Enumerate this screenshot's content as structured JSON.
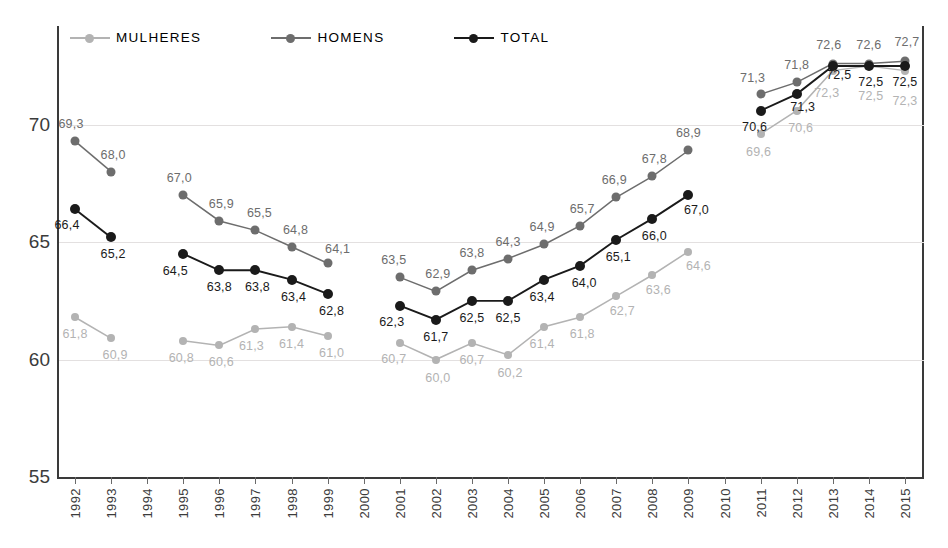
{
  "chart_data": {
    "type": "line",
    "title": "",
    "xlabel": "",
    "ylabel": "",
    "ylim": [
      55,
      74.2
    ],
    "yticks": [
      "55",
      "60",
      "65",
      "70"
    ],
    "grid": true,
    "legend_position": "top-left",
    "categories": [
      "1992",
      "1993",
      "1994",
      "1995",
      "1996",
      "1997",
      "1998",
      "1999",
      "2000",
      "2001",
      "2002",
      "2003",
      "2004",
      "2005",
      "2006",
      "2007",
      "2008",
      "2009",
      "2010",
      "2011",
      "2012",
      "2013",
      "2014",
      "2015"
    ],
    "series": [
      {
        "name": "MULHERES",
        "color": "#b3b3b3",
        "values": [
          61.8,
          60.9,
          null,
          60.8,
          60.6,
          61.3,
          61.4,
          61.0,
          null,
          60.7,
          60.0,
          60.7,
          60.2,
          61.4,
          61.8,
          62.7,
          63.6,
          64.6,
          null,
          69.6,
          70.6,
          72.3,
          72.5,
          72.3
        ],
        "labels": [
          "61,8",
          "60,9",
          null,
          "60,8",
          "60,6",
          "61,3",
          "61,4",
          "61,0",
          null,
          "60,7",
          "60,0",
          "60,7",
          "60,2",
          "61,4",
          "61,8",
          "62,7",
          "63,6",
          "64,6",
          null,
          "69,6",
          "70,6",
          "72,3",
          "72,5",
          "72,3"
        ]
      },
      {
        "name": "HOMENS",
        "color": "#6d6d6d",
        "values": [
          69.3,
          68.0,
          null,
          67.0,
          65.9,
          65.5,
          64.8,
          64.1,
          null,
          63.5,
          62.9,
          63.8,
          64.3,
          64.9,
          65.7,
          66.9,
          67.8,
          68.9,
          null,
          71.3,
          71.8,
          72.6,
          72.6,
          72.7
        ],
        "labels": [
          "69,3",
          "68,0",
          null,
          "67,0",
          "65,9",
          "65,5",
          "64,8",
          "64,1",
          null,
          "63,5",
          "62,9",
          "63,8",
          "64,3",
          "64,9",
          "65,7",
          "66,9",
          "67,8",
          "68,9",
          null,
          "71,3",
          "71,8",
          "72,6",
          "72,6",
          "72,7"
        ]
      },
      {
        "name": "TOTAL",
        "color": "#1a1a1a",
        "values": [
          66.4,
          65.2,
          null,
          64.5,
          63.8,
          63.8,
          63.4,
          62.8,
          null,
          62.3,
          61.7,
          62.5,
          62.5,
          63.4,
          64.0,
          65.1,
          66.0,
          67.0,
          null,
          70.6,
          71.3,
          72.5,
          72.5,
          72.5
        ],
        "labels": [
          "66,4",
          "65,2",
          null,
          "64,5",
          "63,8",
          "63,8",
          "63,4",
          "62,8",
          null,
          "62,3",
          "61,7",
          "62,5",
          "62,5",
          "63,4",
          "64,0",
          "65,1",
          "66,0",
          "67,0",
          null,
          "70,6",
          "71,3",
          "72,5",
          "72,5",
          "72,5"
        ]
      }
    ]
  },
  "legend": {
    "items": [
      {
        "label": "MULHERES",
        "color": "#b3b3b3"
      },
      {
        "label": "HOMENS",
        "color": "#6d6d6d"
      },
      {
        "label": "TOTAL",
        "color": "#1a1a1a"
      }
    ]
  },
  "colors": {
    "mulheres": "#b3b3b3",
    "homens": "#6d6d6d",
    "total": "#1a1a1a",
    "axis": "#3a3a3a",
    "grid": "#e3e0e0",
    "background": "#ffffff"
  },
  "label_offsets": {
    "MULHERES": [
      {
        "dx": 0,
        "dy": 17
      },
      {
        "dx": 4,
        "dy": 17
      },
      null,
      {
        "dx": -2,
        "dy": 17
      },
      {
        "dx": 2,
        "dy": 17
      },
      {
        "dx": -4,
        "dy": 17
      },
      {
        "dx": 0,
        "dy": 17
      },
      {
        "dx": 4,
        "dy": 17
      },
      null,
      {
        "dx": -6,
        "dy": 16
      },
      {
        "dx": 2,
        "dy": 18
      },
      {
        "dx": 0,
        "dy": 17
      },
      {
        "dx": 2,
        "dy": 18
      },
      {
        "dx": -2,
        "dy": 17
      },
      {
        "dx": 2,
        "dy": 17
      },
      {
        "dx": 6,
        "dy": 15
      },
      {
        "dx": 6,
        "dy": 15
      },
      {
        "dx": 10,
        "dy": 14
      },
      null,
      {
        "dx": -2,
        "dy": 18
      },
      {
        "dx": 4,
        "dy": 17
      },
      {
        "dx": -6,
        "dy": 22
      },
      {
        "dx": 2,
        "dy": 30
      },
      {
        "dx": 0,
        "dy": 30
      }
    ],
    "HOMENS": [
      {
        "dx": -4,
        "dy": -17
      },
      {
        "dx": 2,
        "dy": -17
      },
      null,
      {
        "dx": -4,
        "dy": -17
      },
      {
        "dx": 2,
        "dy": -17
      },
      {
        "dx": 4,
        "dy": -17
      },
      {
        "dx": 4,
        "dy": -17
      },
      {
        "dx": 10,
        "dy": -14
      },
      null,
      {
        "dx": -6,
        "dy": -17
      },
      {
        "dx": 2,
        "dy": -17
      },
      {
        "dx": 0,
        "dy": -17
      },
      {
        "dx": 0,
        "dy": -17
      },
      {
        "dx": -2,
        "dy": -17
      },
      {
        "dx": 2,
        "dy": -17
      },
      {
        "dx": -2,
        "dy": -17
      },
      {
        "dx": 2,
        "dy": -17
      },
      {
        "dx": 0,
        "dy": -17
      },
      null,
      {
        "dx": -8,
        "dy": -16
      },
      {
        "dx": 0,
        "dy": -17
      },
      {
        "dx": -4,
        "dy": -19
      },
      {
        "dx": 0,
        "dy": -19
      },
      {
        "dx": 2,
        "dy": -19
      }
    ],
    "TOTAL": [
      {
        "dx": -8,
        "dy": 16
      },
      {
        "dx": 2,
        "dy": 17
      },
      null,
      {
        "dx": -8,
        "dy": 17
      },
      {
        "dx": 0,
        "dy": 17
      },
      {
        "dx": 2,
        "dy": 17
      },
      {
        "dx": 2,
        "dy": 17
      },
      {
        "dx": 4,
        "dy": 17
      },
      null,
      {
        "dx": -8,
        "dy": 16
      },
      {
        "dx": 0,
        "dy": 17
      },
      {
        "dx": 0,
        "dy": 17
      },
      {
        "dx": 0,
        "dy": 17
      },
      {
        "dx": -2,
        "dy": 17
      },
      {
        "dx": 4,
        "dy": 17
      },
      {
        "dx": 2,
        "dy": 17
      },
      {
        "dx": 2,
        "dy": 17
      },
      {
        "dx": 8,
        "dy": 15
      },
      null,
      {
        "dx": -6,
        "dy": 16
      },
      {
        "dx": 6,
        "dy": 13
      },
      {
        "dx": 6,
        "dy": 9
      },
      {
        "dx": 2,
        "dy": 16
      },
      {
        "dx": 0,
        "dy": 16
      }
    ]
  }
}
